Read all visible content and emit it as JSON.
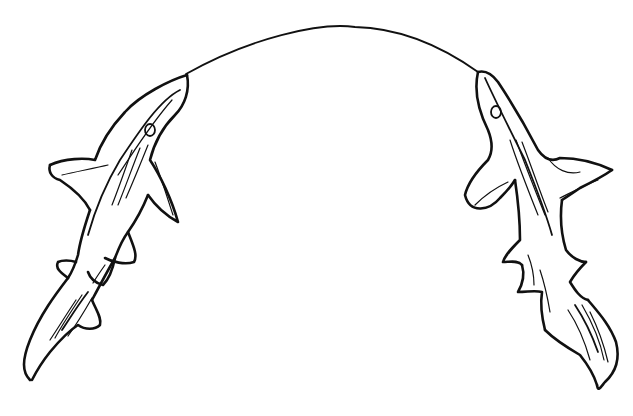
{
  "image": {
    "description": "Black ink line drawing of two sharks facing upward, snouts connected by a single arcing line",
    "background_color": "#ffffff",
    "ink_color": "#111111"
  },
  "elements": {
    "arc": {
      "label": "connecting arc"
    },
    "left_shark": {
      "label": "left shark",
      "facing": "up-right"
    },
    "right_shark": {
      "label": "right shark",
      "facing": "up-left"
    }
  }
}
